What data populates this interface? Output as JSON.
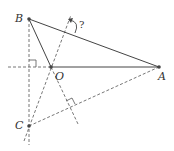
{
  "diagram": {
    "type": "geometry",
    "points": {
      "A": {
        "label": "A",
        "x": 159,
        "y": 67
      },
      "B": {
        "label": "B",
        "x": 29,
        "y": 19
      },
      "C": {
        "label": "C",
        "x": 29,
        "y": 126
      },
      "O": {
        "label": "O",
        "x": 51,
        "y": 67
      }
    },
    "unknown_angle_label": "?",
    "segments_solid": [
      "AB",
      "OB",
      "OA"
    ],
    "segments_dashed": [
      "CA",
      "BC-extended",
      "CO-extended",
      "BO-extended",
      "horizontal-through-O"
    ],
    "right_angles": [
      "at BC ⟂ horizontal line",
      "at BO-extension ⟂ CA"
    ],
    "colors": {
      "line": "#555555",
      "point": "#444444",
      "label": "#333333"
    }
  }
}
